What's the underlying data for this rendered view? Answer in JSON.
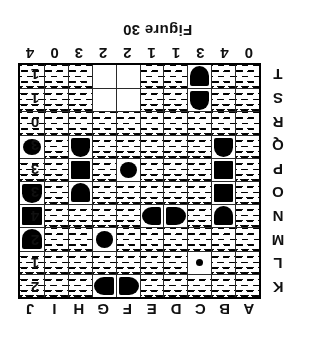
{
  "caption": "Figure 30",
  "puzzle": {
    "type": "battleship-grid",
    "columns": 10,
    "rows": 10,
    "column_labels": [
      "A",
      "B",
      "C",
      "D",
      "E",
      "F",
      "G",
      "H",
      "I",
      "J"
    ],
    "row_labels": [
      "K",
      "L",
      "M",
      "N",
      "O",
      "P",
      "Q",
      "R",
      "S",
      "T"
    ],
    "column_clues": [
      "0",
      "4",
      "3",
      "1",
      "1",
      "2",
      "2",
      "3",
      "0",
      "4"
    ],
    "row_clues": [
      "2",
      "1",
      "2",
      "4",
      "3",
      "3",
      "3",
      "0",
      "1",
      "1"
    ],
    "cells": [
      [
        {
          "state": "water"
        },
        {
          "state": "water"
        },
        {
          "state": "water"
        },
        {
          "state": "water"
        },
        {
          "state": "water"
        },
        {
          "state": "ship",
          "part": "end-left"
        },
        {
          "state": "ship",
          "part": "end-right"
        },
        {
          "state": "water"
        },
        {
          "state": "water"
        },
        {
          "state": "water"
        }
      ],
      [
        {
          "state": "water"
        },
        {
          "state": "water"
        },
        {
          "state": "ship",
          "part": "dot"
        },
        {
          "state": "water"
        },
        {
          "state": "water"
        },
        {
          "state": "water"
        },
        {
          "state": "water"
        },
        {
          "state": "water"
        },
        {
          "state": "water"
        },
        {
          "state": "water"
        }
      ],
      [
        {
          "state": "water"
        },
        {
          "state": "water"
        },
        {
          "state": "water"
        },
        {
          "state": "water"
        },
        {
          "state": "water"
        },
        {
          "state": "water"
        },
        {
          "state": "ship",
          "part": "sub"
        },
        {
          "state": "water"
        },
        {
          "state": "water"
        },
        {
          "state": "ship",
          "part": "end-down"
        }
      ],
      [
        {
          "state": "water"
        },
        {
          "state": "ship",
          "part": "end-down"
        },
        {
          "state": "water"
        },
        {
          "state": "ship",
          "part": "end-left"
        },
        {
          "state": "ship",
          "part": "end-right"
        },
        {
          "state": "water"
        },
        {
          "state": "water"
        },
        {
          "state": "water"
        },
        {
          "state": "water"
        },
        {
          "state": "ship",
          "part": "mid"
        }
      ],
      [
        {
          "state": "water"
        },
        {
          "state": "ship",
          "part": "mid"
        },
        {
          "state": "water"
        },
        {
          "state": "water"
        },
        {
          "state": "water"
        },
        {
          "state": "water"
        },
        {
          "state": "water"
        },
        {
          "state": "ship",
          "part": "end-down"
        },
        {
          "state": "water"
        },
        {
          "state": "ship",
          "part": "end-up"
        }
      ],
      [
        {
          "state": "water"
        },
        {
          "state": "ship",
          "part": "mid"
        },
        {
          "state": "water"
        },
        {
          "state": "water"
        },
        {
          "state": "water"
        },
        {
          "state": "ship",
          "part": "sub"
        },
        {
          "state": "water"
        },
        {
          "state": "ship",
          "part": "mid"
        },
        {
          "state": "water"
        },
        {
          "state": "water"
        }
      ],
      [
        {
          "state": "water"
        },
        {
          "state": "ship",
          "part": "end-up"
        },
        {
          "state": "water"
        },
        {
          "state": "water"
        },
        {
          "state": "water"
        },
        {
          "state": "water"
        },
        {
          "state": "water"
        },
        {
          "state": "ship",
          "part": "end-up"
        },
        {
          "state": "water"
        },
        {
          "state": "ship",
          "part": "sub"
        }
      ],
      [
        {
          "state": "water"
        },
        {
          "state": "water"
        },
        {
          "state": "water"
        },
        {
          "state": "water"
        },
        {
          "state": "water"
        },
        {
          "state": "water"
        },
        {
          "state": "water"
        },
        {
          "state": "water"
        },
        {
          "state": "water"
        },
        {
          "state": "water"
        }
      ],
      [
        {
          "state": "water"
        },
        {
          "state": "water"
        },
        {
          "state": "ship",
          "part": "end-up"
        },
        {
          "state": "water"
        },
        {
          "state": "water"
        },
        {
          "state": "blank"
        },
        {
          "state": "blank"
        },
        {
          "state": "water"
        },
        {
          "state": "water"
        },
        {
          "state": "water"
        }
      ],
      [
        {
          "state": "water"
        },
        {
          "state": "water"
        },
        {
          "state": "ship",
          "part": "end-down"
        },
        {
          "state": "water"
        },
        {
          "state": "water"
        },
        {
          "state": "blank"
        },
        {
          "state": "blank"
        },
        {
          "state": "water"
        },
        {
          "state": "water"
        },
        {
          "state": "water"
        }
      ]
    ]
  }
}
